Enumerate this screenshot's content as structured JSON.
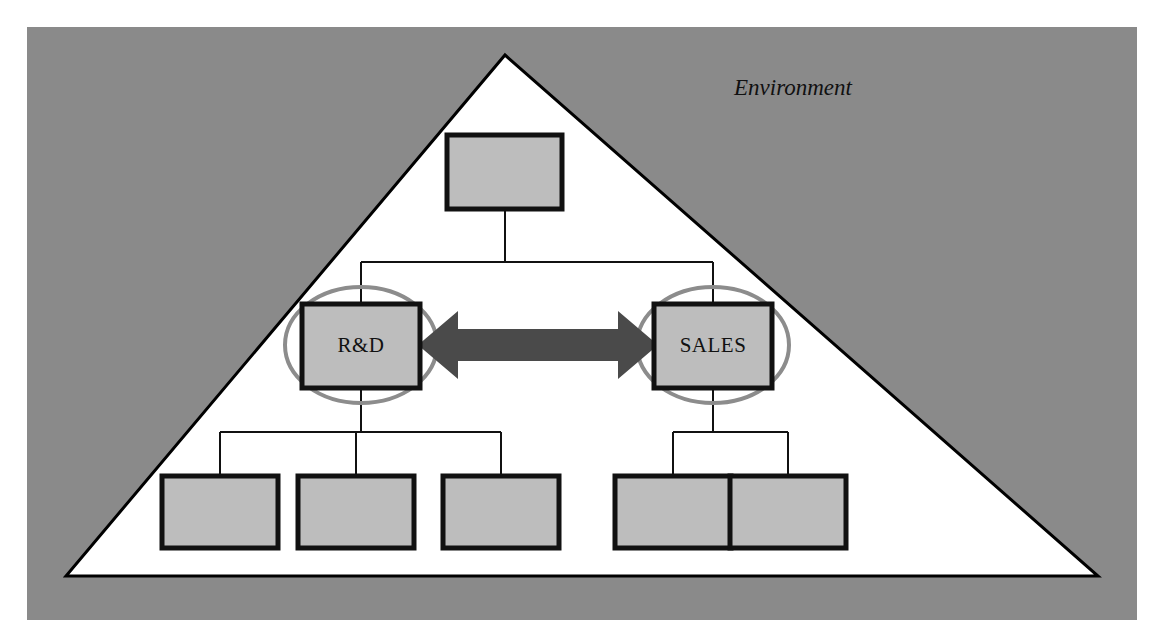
{
  "canvas": {
    "width": 1165,
    "height": 643,
    "page_background": "#ffffff"
  },
  "panel": {
    "name": "environment-panel",
    "background_color": "#8a8a8a",
    "x": 27,
    "y": 27,
    "width": 1110,
    "height": 593
  },
  "environment": {
    "label": "Environment",
    "label_x": 793,
    "label_y": 90,
    "triangle": {
      "fill": "#ffffff",
      "stroke": "#000000",
      "stroke_width": 3,
      "apex_x": 505,
      "apex_y": 55,
      "left_x": 66,
      "left_y": 576,
      "right_x": 1098,
      "right_y": 576
    }
  },
  "theme": {
    "box_fill": "#bdbdbd",
    "box_stroke": "#111111",
    "box_stroke_width": 5,
    "connector_stroke": "#111111",
    "connector_width": 2,
    "arrow_fill": "#4a4a4a",
    "ellipse_stroke": "#8c8c8c",
    "ellipse_stroke_width": 4,
    "ellipse_fill": "none",
    "text_color": "#111111"
  },
  "nodes": [
    {
      "id": "top",
      "label": "",
      "x": 447,
      "y": 135,
      "width": 115,
      "height": 74,
      "name": "org-node-top"
    },
    {
      "id": "rd",
      "label": "R&D",
      "x": 302,
      "y": 304,
      "width": 118,
      "height": 84,
      "name": "org-node-rd"
    },
    {
      "id": "sales",
      "label": "SALES",
      "x": 654,
      "y": 304,
      "width": 118,
      "height": 84,
      "name": "org-node-sales"
    },
    {
      "id": "rd-child-1",
      "label": "",
      "x": 162,
      "y": 476,
      "width": 116,
      "height": 72,
      "name": "org-node-rd-child-1"
    },
    {
      "id": "rd-child-2",
      "label": "",
      "x": 298,
      "y": 476,
      "width": 116,
      "height": 72,
      "name": "org-node-rd-child-2"
    },
    {
      "id": "rd-child-3",
      "label": "",
      "x": 443,
      "y": 476,
      "width": 116,
      "height": 72,
      "name": "org-node-rd-child-3"
    },
    {
      "id": "sales-child-1",
      "label": "",
      "x": 615,
      "y": 476,
      "width": 116,
      "height": 72,
      "name": "org-node-sales-child-1"
    },
    {
      "id": "sales-child-2",
      "label": "",
      "x": 730,
      "y": 476,
      "width": 116,
      "height": 72,
      "name": "org-node-sales-child-2"
    }
  ],
  "highlight_ellipses": [
    {
      "id": "rd-highlight",
      "cx": 361,
      "cy": 345,
      "rx": 76,
      "ry": 58,
      "name": "highlight-ellipse-rd"
    },
    {
      "id": "sales-highlight",
      "cx": 713,
      "cy": 345,
      "rx": 76,
      "ry": 58,
      "name": "highlight-ellipse-sales"
    }
  ],
  "connectors": {
    "top_stem": {
      "x": 505,
      "y1": 209,
      "y2": 262,
      "name": "connector-top-stem"
    },
    "level1_bar": {
      "y": 262,
      "x1": 361,
      "x2": 713,
      "name": "connector-level1-bar"
    },
    "rd_drop": {
      "x": 361,
      "y1": 262,
      "y2": 304,
      "name": "connector-rd-drop"
    },
    "sales_drop": {
      "x": 713,
      "y1": 262,
      "y2": 304,
      "name": "connector-sales-drop"
    },
    "rd_stem": {
      "x": 361,
      "y1": 388,
      "y2": 432,
      "name": "connector-rd-stem"
    },
    "rd_bar": {
      "y": 432,
      "x1": 220,
      "x2": 501,
      "name": "connector-rd-bar"
    },
    "rd_drops": [
      {
        "x": 220,
        "y1": 432,
        "y2": 476,
        "name": "connector-rd-child-1-drop"
      },
      {
        "x": 356,
        "y1": 432,
        "y2": 476,
        "name": "connector-rd-child-2-drop"
      },
      {
        "x": 501,
        "y1": 432,
        "y2": 476,
        "name": "connector-rd-child-3-drop"
      }
    ],
    "sales_stem": {
      "x": 713,
      "y1": 388,
      "y2": 432,
      "name": "connector-sales-stem"
    },
    "sales_bar": {
      "y": 432,
      "x1": 673,
      "x2": 788,
      "name": "connector-sales-bar"
    },
    "sales_drops": [
      {
        "x": 673,
        "y1": 432,
        "y2": 476,
        "name": "connector-sales-child-1-drop"
      },
      {
        "x": 788,
        "y1": 432,
        "y2": 476,
        "name": "connector-sales-child-2-drop"
      }
    ]
  },
  "relation_arrow": {
    "name": "bidirectional-arrow-rd-sales",
    "description": "double-headed arrow linking R&D and SALES",
    "fill": "#4a4a4a",
    "left_tip_x": 418,
    "right_tip_x": 658,
    "center_y": 345,
    "shaft_half_height": 16,
    "head_half_height": 34,
    "head_length": 40
  }
}
